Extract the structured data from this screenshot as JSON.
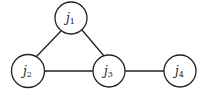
{
  "nodes": [
    {
      "id": "j1",
      "base": "j",
      "sub": "1",
      "cx": 71,
      "cy": 18
    },
    {
      "id": "j2",
      "base": "j",
      "sub": "2",
      "cx": 28,
      "cy": 71
    },
    {
      "id": "j3",
      "base": "j",
      "sub": "3",
      "cx": 109,
      "cy": 71
    },
    {
      "id": "j4",
      "base": "j",
      "sub": "4",
      "cx": 180,
      "cy": 71
    }
  ],
  "edges": [
    [
      "j1",
      "j2"
    ],
    [
      "j1",
      "j3"
    ],
    [
      "j2",
      "j3"
    ],
    [
      "j3",
      "j4"
    ]
  ]
}
